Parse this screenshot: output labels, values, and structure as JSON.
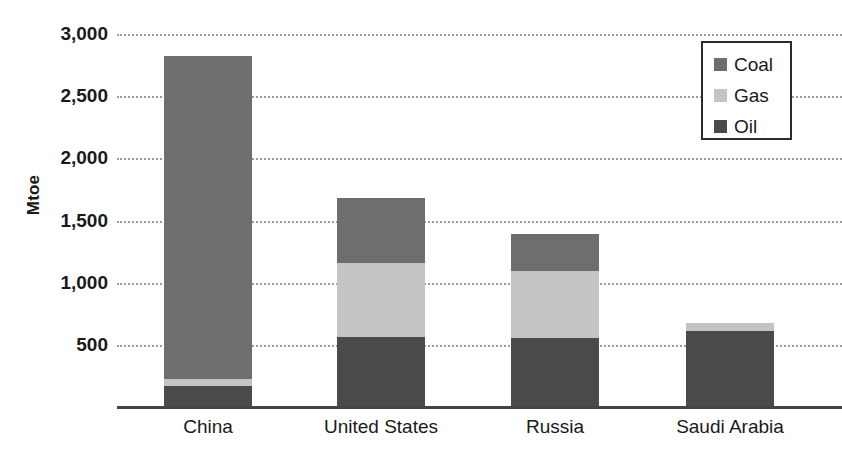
{
  "chart_data": {
    "type": "bar",
    "stacked": true,
    "title": "",
    "subtitle": "",
    "xlabel": "",
    "ylabel": "Mtoe",
    "categories": [
      "China",
      "United States",
      "Russia",
      "Saudi Arabia"
    ],
    "series": [
      {
        "name": "Oil",
        "values": [
          180,
          570,
          560,
          620
        ],
        "color": "#4a4a4a"
      },
      {
        "name": "Gas",
        "values": [
          55,
          600,
          540,
          65
        ],
        "color": "#c4c4c4"
      },
      {
        "name": "Coal",
        "values": [
          2595,
          520,
          300,
          0
        ],
        "color": "#6e6e6e"
      }
    ],
    "totals": [
      2830,
      1690,
      1400,
      685
    ],
    "ylim": [
      0,
      3000
    ],
    "yticks": [
      500,
      1000,
      1500,
      2000,
      2500,
      3000
    ],
    "ytick_labels": [
      "500",
      "1,000",
      "1,500",
      "2,000",
      "2,500",
      "3,000"
    ],
    "grid": "horizontal-dotted",
    "legend_position": "top-right",
    "units": "Mtoe"
  },
  "legend": {
    "items": [
      {
        "label": "Coal",
        "color": "#6e6e6e"
      },
      {
        "label": "Gas",
        "color": "#c4c4c4"
      },
      {
        "label": "Oil",
        "color": "#4a4a4a"
      }
    ]
  }
}
